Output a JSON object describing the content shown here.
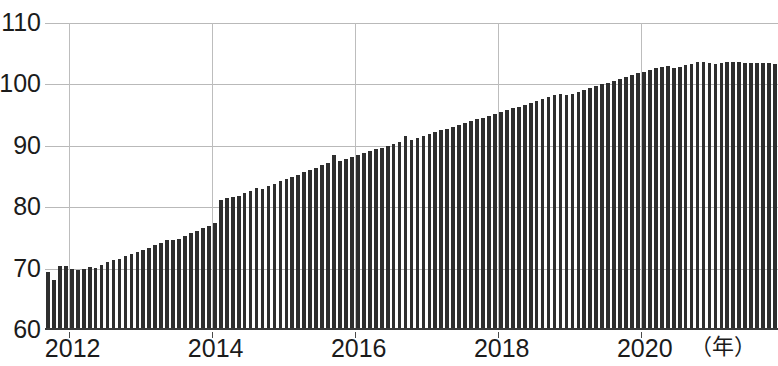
{
  "chart_data": {
    "type": "bar",
    "title": "",
    "subtitle": "",
    "xlabel": "（年）",
    "ylabel": "",
    "xlim": [
      2011.6667,
      2021.9167
    ],
    "ylim": [
      60,
      110
    ],
    "grid": "both",
    "legend": "none",
    "series_name": "monthly index",
    "bar_color": "#2e2e2e",
    "y_ticks": [
      60,
      70,
      80,
      90,
      100,
      110
    ],
    "y_tick_labels": [
      "60",
      "70",
      "80",
      "90",
      "100",
      "110"
    ],
    "x_ticks": [
      2012,
      2014,
      2016,
      2018,
      2020
    ],
    "x_tick_labels": [
      "2012",
      "2014",
      "2016",
      "2018",
      "2020"
    ],
    "x_unit_label": "（年）",
    "frequency": "monthly",
    "x_start": "2011-09",
    "x_end": "2021-11",
    "x": [
      "2011-09",
      "2011-10",
      "2011-11",
      "2011-12",
      "2012-01",
      "2012-02",
      "2012-03",
      "2012-04",
      "2012-05",
      "2012-06",
      "2012-07",
      "2012-08",
      "2012-09",
      "2012-10",
      "2012-11",
      "2012-12",
      "2013-01",
      "2013-02",
      "2013-03",
      "2013-04",
      "2013-05",
      "2013-06",
      "2013-07",
      "2013-08",
      "2013-09",
      "2013-10",
      "2013-11",
      "2013-12",
      "2014-01",
      "2014-02",
      "2014-03",
      "2014-04",
      "2014-05",
      "2014-06",
      "2014-07",
      "2014-08",
      "2014-09",
      "2014-10",
      "2014-11",
      "2014-12",
      "2015-01",
      "2015-02",
      "2015-03",
      "2015-04",
      "2015-05",
      "2015-06",
      "2015-07",
      "2015-08",
      "2015-09",
      "2015-10",
      "2015-11",
      "2015-12",
      "2016-01",
      "2016-02",
      "2016-03",
      "2016-04",
      "2016-05",
      "2016-06",
      "2016-07",
      "2016-08",
      "2016-09",
      "2016-10",
      "2016-11",
      "2016-12",
      "2017-01",
      "2017-02",
      "2017-03",
      "2017-04",
      "2017-05",
      "2017-06",
      "2017-07",
      "2017-08",
      "2017-09",
      "2017-10",
      "2017-11",
      "2017-12",
      "2018-01",
      "2018-02",
      "2018-03",
      "2018-04",
      "2018-05",
      "2018-06",
      "2018-07",
      "2018-08",
      "2018-09",
      "2018-10",
      "2018-11",
      "2018-12",
      "2019-01",
      "2019-02",
      "2019-03",
      "2019-04",
      "2019-05",
      "2019-06",
      "2019-07",
      "2019-08",
      "2019-09",
      "2019-10",
      "2019-11",
      "2019-12",
      "2020-01",
      "2020-02",
      "2020-03",
      "2020-04",
      "2020-05",
      "2020-06",
      "2020-07",
      "2020-08",
      "2020-09",
      "2020-10",
      "2020-11",
      "2020-12",
      "2021-01",
      "2021-02",
      "2021-03",
      "2021-04",
      "2021-05",
      "2021-06",
      "2021-07",
      "2021-08",
      "2021-09",
      "2021-10",
      "2021-11"
    ],
    "values": [
      69.4,
      68.2,
      70.4,
      70.5,
      70.0,
      69.8,
      70.0,
      70.3,
      70.1,
      70.6,
      71.0,
      71.4,
      71.6,
      72.0,
      72.3,
      72.7,
      73.0,
      73.4,
      73.8,
      74.2,
      74.6,
      74.7,
      74.9,
      75.3,
      75.8,
      76.2,
      76.6,
      77.0,
      77.4,
      81.2,
      81.5,
      81.7,
      81.9,
      82.3,
      82.7,
      83.2,
      83.0,
      83.4,
      83.8,
      84.2,
      84.6,
      85.0,
      85.3,
      85.7,
      86.0,
      86.4,
      86.8,
      87.2,
      88.5,
      87.6,
      87.9,
      88.2,
      88.5,
      88.8,
      89.1,
      89.4,
      89.7,
      90.0,
      90.3,
      90.6,
      91.6,
      91.0,
      91.3,
      91.6,
      91.9,
      92.2,
      92.5,
      92.8,
      93.1,
      93.4,
      93.7,
      94.0,
      94.3,
      94.6,
      94.9,
      95.2,
      95.5,
      95.8,
      96.1,
      96.4,
      96.7,
      97.0,
      97.3,
      97.6,
      97.9,
      98.2,
      98.5,
      98.2,
      98.5,
      98.8,
      99.1,
      99.4,
      99.7,
      100.0,
      100.3,
      100.6,
      100.9,
      101.2,
      101.5,
      101.8,
      102.1,
      102.4,
      102.6,
      102.8,
      103.0,
      102.6,
      102.9,
      103.2,
      103.4,
      103.6,
      103.7,
      103.5,
      103.3,
      103.5,
      103.6,
      103.6,
      103.6,
      103.5,
      103.5,
      103.5,
      103.5,
      103.5,
      103.4
    ]
  }
}
